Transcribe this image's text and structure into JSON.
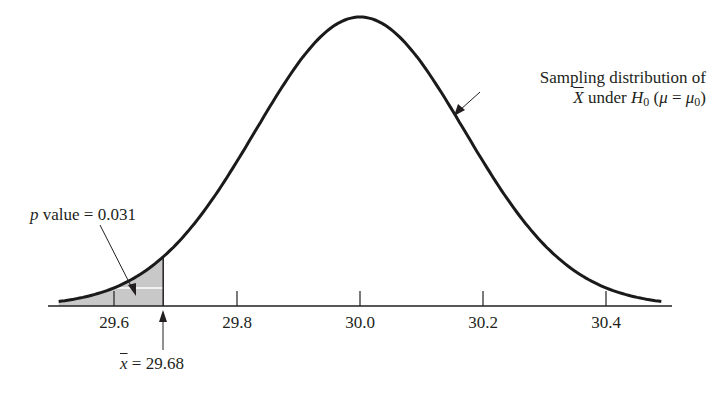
{
  "chart_data": {
    "type": "area",
    "title": "",
    "xlabel": "",
    "ylabel": "",
    "distribution": "normal",
    "mean": 30.0,
    "sd": 0.17,
    "xlim": [
      29.5,
      30.5
    ],
    "x_ticks": [
      29.6,
      29.8,
      30.0,
      30.2,
      30.4
    ],
    "x_tick_labels": [
      "29.6",
      "29.8",
      "30.0",
      "30.2",
      "30.4"
    ],
    "shaded_region": {
      "from": 29.5,
      "to": 29.68,
      "area": 0.031
    },
    "observed_value": 29.68,
    "grid": false,
    "annotations": [
      {
        "text": "p value = 0.031",
        "target": "shaded left tail"
      },
      {
        "text": "x̄ = 29.68",
        "target": "x = 29.68"
      },
      {
        "text": "Sampling distribution of X̄ under H0 (μ = μ0)",
        "target": "curve"
      }
    ]
  },
  "labels": {
    "pvalue_p": "p",
    "pvalue_rest": " value = 0.031",
    "xbar_sym": "x",
    "xbar_rest": " = 29.68",
    "dist_line1": "Sampling distribution of",
    "dist_X": "X",
    "dist_under": " under ",
    "dist_H": "H",
    "dist_sub0": "0",
    "dist_paren_open": " (",
    "dist_mu": "μ",
    "dist_eq": " = ",
    "dist_mu2": "μ",
    "dist_sub02": "0",
    "dist_paren_close": ")"
  },
  "colors": {
    "curve": "#1a1a1a",
    "shade": "#c8c8c8",
    "axis": "#231f20"
  }
}
